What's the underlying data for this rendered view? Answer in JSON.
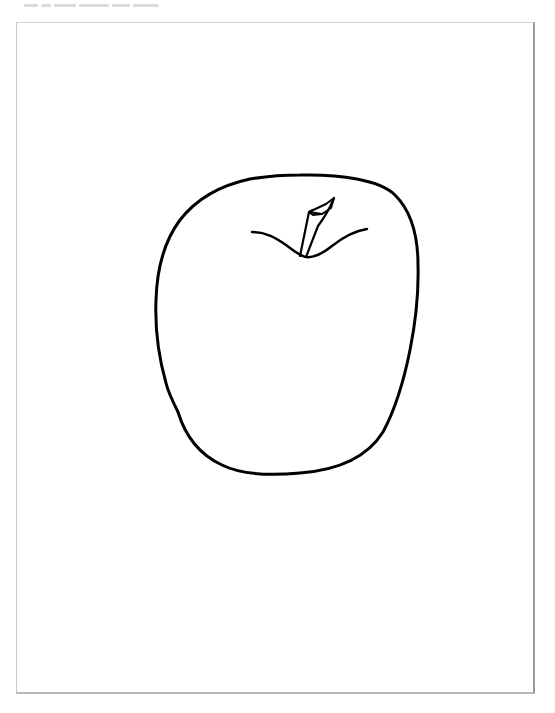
{
  "image": {
    "subject": "apple line drawing",
    "description": "Black outline drawing of an apple with a short stem on a white page",
    "stroke_color": "#000000",
    "background_color": "#ffffff",
    "page_border_color": "#9a9a9a"
  },
  "elements": {
    "apple_body": "apple-outline",
    "stem": "stem",
    "top_dimple": "dimple-curve"
  }
}
